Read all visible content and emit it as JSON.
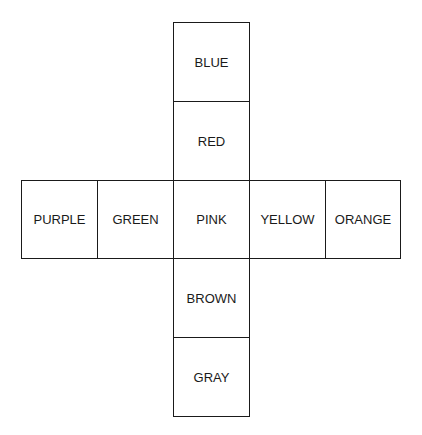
{
  "diagram": {
    "type": "cube-net",
    "cells": [
      {
        "label": "BLUE",
        "row": 0,
        "col": 2
      },
      {
        "label": "RED",
        "row": 1,
        "col": 2
      },
      {
        "label": "PURPLE",
        "row": 2,
        "col": 0
      },
      {
        "label": "GREEN",
        "row": 2,
        "col": 1
      },
      {
        "label": "PINK",
        "row": 2,
        "col": 2
      },
      {
        "label": "YELLOW",
        "row": 2,
        "col": 3
      },
      {
        "label": "ORANGE",
        "row": 2,
        "col": 4
      },
      {
        "label": "BROWN",
        "row": 3,
        "col": 2
      },
      {
        "label": "GRAY",
        "row": 4,
        "col": 2
      }
    ]
  }
}
